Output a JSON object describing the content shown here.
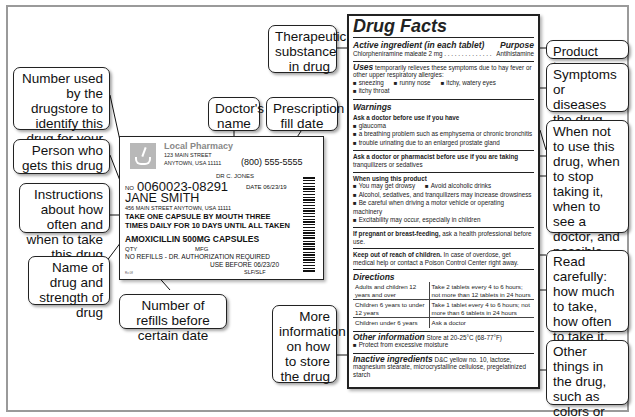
{
  "callouts": {
    "therapeutic": "Therapeutic substance in drug",
    "number": "Number used by the drugstore to identify this drug for your refills",
    "doctor": "Doctor's name",
    "fill_date": "Prescription fill date",
    "person": "Person who gets this drug",
    "instructions": "Instructions about how often and when to take this drug",
    "name_strength": "Name of drug and strength of drug",
    "refills": "Number of refills before certain date",
    "storage": "More information on how to store the drug",
    "product_type": "Product type",
    "symptoms": "Symptoms or diseases the drug treats",
    "warnings": "When not to use this drug, when to stop taking it, when to see a doctor, and possible side effects",
    "directions": "Read carefully: how much to take, how often to take it, and when to stop taking it",
    "inactive": "Other things in the drug, such as colors or flavorings"
  },
  "rx_label": {
    "pharmacy": "Local Pharmacy",
    "address1": "123 MAIN STREET",
    "address2": "ANYTOWN, USA 11111",
    "phone": "(800) 555-5555",
    "doctor": "DR C. JONES",
    "no_label": "NO",
    "rx_number": "0060023-08291",
    "date": "DATE 06/23/19",
    "patient": "JANE SMITH",
    "patient_address": "456 MAIN STREET ANYTOWN, USA 11111",
    "instructions_line1": "TAKE ONE CAPSULE BY MOUTH THREE",
    "instructions_line2": "TIMES DAILY FOR 10 DAYS UNTIL ALL TAKEN",
    "drug": "AMOXICILLIN 500MG CAPSULES",
    "qty": "QTY",
    "mfg": "MFG",
    "refills": "NO REFILLS - DR. AUTHORIZATION REQUIRED",
    "use_before": "USE BEFORE 06/23/20",
    "initials": "SLF/SLF",
    "code": "Rx 0ff"
  },
  "facts": {
    "title": "Drug Facts",
    "active_header": "Active ingredient (in each tablet)",
    "purpose_header": "Purpose",
    "active_ingredient": "Chlorpheniramine maleate 2 mg . . . . . . . . . . . . . .",
    "purpose": "Antihistamine",
    "uses_lead": "Uses",
    "uses_text": " temporarily relieves these symptoms due to hay fever or other upper respiratory allergies:",
    "uses_items": [
      "sneezing",
      "runny nose",
      "itchy, watery eyes",
      "itchy throat"
    ],
    "warnings_header": "Warnings",
    "ask_doctor": "Ask a doctor before use if you have",
    "ask_doctor_items": [
      "glaucoma",
      "a breathing problem such as emphysema or chronic bronchitis",
      "trouble urinating due to an enlarged prostate gland"
    ],
    "ask_pharmacist": "Ask a doctor or pharmacist before use if you are taking",
    "ask_pharmacist_text": "tranquilizers or sedatives",
    "when_using": "When using this product",
    "when_using_items": [
      "You may get drowsy",
      "Avoid alcoholic drinks",
      "Alcohol, sedatives, and tranquilizers may increase drowsiness",
      "Be careful when driving a motor vehicle or operating machinery",
      "Excitability may occur, especially in children"
    ],
    "pregnant_bold": "If pregnant or breast-feeding,",
    "pregnant_text": " ask a health professional before use.",
    "keep_out_bold": "Keep out of reach of children.",
    "keep_out_text": " In case of overdose, get medical help or contact a Poison Control Center right away.",
    "directions_header": "Directions",
    "directions": [
      {
        "who": "Adults and children 12 years and over",
        "dose": "Take 2 tablets every 4 to 6 hours; not more than 12 tablets in 24 hours"
      },
      {
        "who": "Children 6 years to under 12 years",
        "dose": "Take 1 tablet every 4 to 6 hours; not more than 6 tablets in 24 hours"
      },
      {
        "who": "Children under 6 years",
        "dose": "Ask a doctor"
      }
    ],
    "other_header": "Other information",
    "other_text": " Store at 20-25°C (68-77°F)",
    "other_item": "Protect from excessive moisture",
    "inactive_header": "Inactive ingredients",
    "inactive_text": " D&C yellow no. 10, lactose, magnesium stearate, microcrystalline cellulose, pregelatinized starch"
  }
}
